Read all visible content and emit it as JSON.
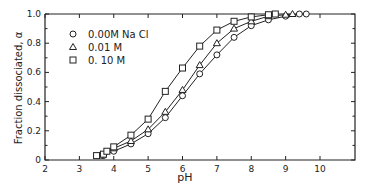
{
  "chart_data": {
    "type": "line",
    "title": "",
    "xlabel": "pH",
    "ylabel": "Fraction dissociated, α",
    "xlim": [
      2,
      11
    ],
    "ylim": [
      0,
      1.0
    ],
    "x_ticks": [
      2,
      3,
      4,
      5,
      6,
      7,
      8,
      9,
      10
    ],
    "x_tick_labels": [
      "2",
      "3",
      "4",
      "5",
      "6",
      "7",
      "8",
      "9",
      "10"
    ],
    "y_ticks": [
      0,
      0.2,
      0.4,
      0.6,
      0.8,
      1.0
    ],
    "y_tick_labels": [
      "0",
      "0.2",
      "0.4",
      "0.6",
      "0.8",
      "1.0"
    ],
    "grid": false,
    "legend_position": "upper left",
    "series": [
      {
        "name": "0.00M Na Cl",
        "marker": "circle",
        "x": [
          3.7,
          4.0,
          4.5,
          5.0,
          5.5,
          6.0,
          6.5,
          7.0,
          7.5,
          8.0,
          8.5,
          9.0,
          9.4,
          9.6
        ],
        "y": [
          0.03,
          0.06,
          0.11,
          0.18,
          0.29,
          0.44,
          0.59,
          0.72,
          0.84,
          0.92,
          0.96,
          0.985,
          1.0,
          1.0
        ]
      },
      {
        "name": "0.01 M",
        "marker": "triangle",
        "x": [
          3.6,
          4.0,
          4.5,
          5.0,
          5.5,
          6.0,
          6.5,
          7.0,
          7.5,
          8.0,
          8.5,
          9.0,
          9.2
        ],
        "y": [
          0.03,
          0.08,
          0.13,
          0.21,
          0.33,
          0.48,
          0.65,
          0.8,
          0.9,
          0.95,
          0.985,
          0.995,
          1.0
        ]
      },
      {
        "name": "0.10 M",
        "marker": "square",
        "x": [
          3.5,
          3.7,
          3.8,
          4.0,
          4.5,
          5.0,
          5.5,
          6.0,
          6.5,
          7.0,
          7.5,
          8.0,
          8.5,
          8.7
        ],
        "y": [
          0.03,
          0.04,
          0.06,
          0.09,
          0.17,
          0.28,
          0.47,
          0.63,
          0.78,
          0.89,
          0.95,
          0.98,
          0.995,
          1.0
        ]
      }
    ]
  },
  "legend": {
    "items": [
      {
        "symbol": "circle",
        "label": "0.00M  Na Cl"
      },
      {
        "symbol": "triangle",
        "label": "0.01 M"
      },
      {
        "symbol": "square",
        "label": "0. 10 M"
      }
    ]
  },
  "style": {
    "line_color": "#222222",
    "marker_fill": "#ffffff",
    "background": "#ffffff"
  }
}
